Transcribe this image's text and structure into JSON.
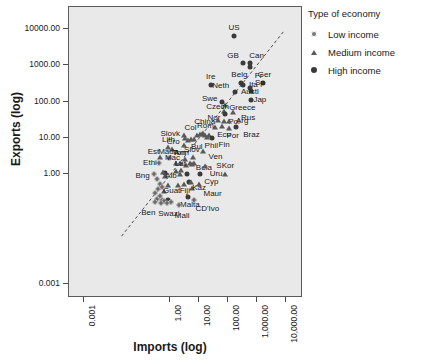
{
  "chart_data": {
    "type": "scatter",
    "title": "",
    "xlabel": "Imports (log)",
    "ylabel": "Exports (log)",
    "xscale": "log",
    "yscale": "log",
    "grid": false,
    "xticks": [
      "0.001",
      "1.00",
      "10.00",
      "100.00",
      "1,000.00",
      "10,000.00"
    ],
    "xtick_values": [
      0.001,
      1.0,
      10.0,
      100.0,
      1000.0,
      10000.0
    ],
    "yticks": [
      "10000.00",
      "1000.00",
      "100.00",
      "10.00",
      "1.00",
      "0.001"
    ],
    "ytick_values": [
      10000.0,
      1000.0,
      100.0,
      10.0,
      1.0,
      0.001
    ],
    "xlim": [
      0.0003,
      40000.0
    ],
    "ylim": [
      0.0004,
      40000.0
    ],
    "reference_line": {
      "style": "dashed",
      "description": "diagonal y = x trend line"
    },
    "legend": {
      "title": "Type of economy",
      "position": "right",
      "entries": [
        {
          "label": "Low income",
          "marker": "small-dot"
        },
        {
          "label": "Medium income",
          "marker": "triangle"
        },
        {
          "label": "High income",
          "marker": "filled-circle"
        }
      ]
    },
    "points": [
      {
        "name": "US",
        "x": 160,
        "y": 6500,
        "group": "High income",
        "lx": 0,
        "ly": -9
      },
      {
        "name": "GB",
        "x": 330,
        "y": 1180,
        "group": "High income",
        "lx": -10,
        "ly": -8
      },
      {
        "name": "Can",
        "x": 560,
        "y": 1160,
        "group": "High income",
        "lx": 7,
        "ly": -8
      },
      {
        "name": "Fr",
        "x": 560,
        "y": 880,
        "group": "High income",
        "lx": 9,
        "ly": 8
      },
      {
        "name": "Ger",
        "x": 1700,
        "y": 330,
        "group": "High income",
        "lx": 1,
        "ly": -9
      },
      {
        "name": "Belg",
        "x": 290,
        "y": 320,
        "group": "High income",
        "lx": -2,
        "ly": -9
      },
      {
        "name": "Ita",
        "x": 340,
        "y": 290,
        "group": "High income",
        "lx": 10,
        "ly": -1
      },
      {
        "name": "Sp",
        "x": 570,
        "y": 240,
        "group": "High income",
        "lx": 10,
        "ly": -6
      },
      {
        "name": "Jap",
        "x": 620,
        "y": 195,
        "group": "High income",
        "lx": 9,
        "ly": 8
      },
      {
        "name": "Ire",
        "x": 25,
        "y": 295,
        "group": "High income",
        "lx": 0,
        "ly": -9
      },
      {
        "name": "Neth",
        "x": 170,
        "y": 190,
        "group": "High income",
        "lx": -14,
        "ly": -7
      },
      {
        "name": "Austl",
        "x": 620,
        "y": 112,
        "group": "High income",
        "lx": -1,
        "ly": -9
      },
      {
        "name": "Swe",
        "x": 60,
        "y": 96,
        "group": "High income",
        "lx": -12,
        "ly": -4
      },
      {
        "name": "Greece",
        "x": 80,
        "y": 82,
        "group": "Medium income",
        "lx": 17,
        "ly": 2
      },
      {
        "name": "Czech",
        "x": 70,
        "y": 55,
        "group": "Medium income",
        "lx": -6,
        "ly": -5
      },
      {
        "name": "Nor",
        "x": 78,
        "y": 46,
        "group": "High income",
        "lx": -11,
        "ly": 3
      },
      {
        "name": "Rus",
        "x": 150,
        "y": 52,
        "group": "Medium income",
        "lx": 15,
        "ly": 5
      },
      {
        "name": "China",
        "x": 44,
        "y": 31,
        "group": "Medium income",
        "lx": -13,
        "ly": 1
      },
      {
        "name": "Pol",
        "x": 72,
        "y": 30,
        "group": "Medium income",
        "lx": 10,
        "ly": 0
      },
      {
        "name": "Arg",
        "x": 110,
        "y": 29,
        "group": "Medium income",
        "lx": 13,
        "ly": -1
      },
      {
        "name": "Braz",
        "x": 195,
        "y": 20,
        "group": "High income",
        "lx": 15,
        "ly": 7
      },
      {
        "name": "Por",
        "x": 105,
        "y": 19,
        "group": "Medium income",
        "lx": 4,
        "ly": 7
      },
      {
        "name": "Ecu",
        "x": 62,
        "y": 21,
        "group": "Medium income",
        "lx": 2,
        "ly": 8
      },
      {
        "name": "Rom",
        "x": 14,
        "y": 14,
        "group": "Medium income",
        "lx": 2,
        "ly": -8
      },
      {
        "name": "Col",
        "x": 11,
        "y": 13,
        "group": "Medium income",
        "lx": -10,
        "ly": -7
      },
      {
        "name": "Fin",
        "x": 28,
        "y": 10,
        "group": "High income",
        "lx": 12,
        "ly": 6
      },
      {
        "name": "Phil",
        "x": 19,
        "y": 10.5,
        "group": "Medium income",
        "lx": 4,
        "ly": 8
      },
      {
        "name": "Bul",
        "x": 6.5,
        "y": 9.5,
        "group": "Medium income",
        "lx": 3,
        "ly": 7
      },
      {
        "name": "Slovk",
        "x": 3.0,
        "y": 12,
        "group": "Medium income",
        "lx": -14,
        "ly": -2
      },
      {
        "name": "Cro",
        "x": 3.0,
        "y": 6.5,
        "group": "Medium income",
        "lx": -11,
        "ly": -4
      },
      {
        "name": "Lith",
        "x": 0.85,
        "y": 5.5,
        "group": "Medium income",
        "lx": 0,
        "ly": -8
      },
      {
        "name": "Arm",
        "x": 1.1,
        "y": 4.9,
        "group": "Medium income",
        "lx": 10,
        "ly": 3
      },
      {
        "name": "Ven",
        "x": 14,
        "y": 4.4,
        "group": "Medium income",
        "lx": 12,
        "ly": 5
      },
      {
        "name": "Slov",
        "x": 6.0,
        "y": 3.1,
        "group": "Medium income",
        "lx": -1,
        "ly": -8
      },
      {
        "name": "Ton",
        "x": 3.2,
        "y": 2.7,
        "group": "Medium income",
        "lx": -6,
        "ly": -7
      },
      {
        "name": "Mada",
        "x": 0.9,
        "y": 2.8,
        "group": "Low income",
        "lx": -1,
        "ly": -7
      },
      {
        "name": "Est",
        "x": 0.45,
        "y": 3.0,
        "group": "Medium income",
        "lx": -7,
        "ly": -6
      },
      {
        "name": "Ethi",
        "x": 0.4,
        "y": 2.0,
        "group": "Low income",
        "lx": -9,
        "ly": -1
      },
      {
        "name": "Mac",
        "x": 1.5,
        "y": 2.1,
        "group": "Medium income",
        "lx": -3,
        "ly": -6
      },
      {
        "name": "Bela",
        "x": 6.5,
        "y": 2.0,
        "group": "Medium income",
        "lx": 10,
        "ly": 4
      },
      {
        "name": "Uru",
        "x": 16,
        "y": 1.7,
        "group": "Medium income",
        "lx": 11,
        "ly": 7
      },
      {
        "name": "Lat",
        "x": 2.4,
        "y": 1.3,
        "group": "Medium income",
        "lx": -1,
        "ly": -7
      },
      {
        "name": "SKor",
        "x": 80,
        "y": 1.05,
        "group": "Medium income",
        "lx": 0,
        "ly": -9
      },
      {
        "name": "Bng",
        "x": 0.26,
        "y": 1.0,
        "group": "Low income",
        "lx": -11,
        "ly": 1
      },
      {
        "name": "Alb",
        "x": 0.55,
        "y": 1.15,
        "group": "Medium income",
        "lx": 8,
        "ly": 3
      },
      {
        "name": "Cyp",
        "x": 11,
        "y": 1.0,
        "group": "High income",
        "lx": 11,
        "ly": 7
      },
      {
        "name": "Kaz",
        "x": 5.2,
        "y": 0.62,
        "group": "Medium income",
        "lx": 8,
        "ly": 5
      },
      {
        "name": "Maur",
        "x": 9.5,
        "y": 0.55,
        "group": "Medium income",
        "lx": 14,
        "ly": 9
      },
      {
        "name": "Guat",
        "x": 0.8,
        "y": 0.5,
        "group": "Medium income",
        "lx": 4,
        "ly": 5
      },
      {
        "name": "Fiji",
        "x": 1.8,
        "y": 0.5,
        "group": "Medium income",
        "lx": 7,
        "ly": 5
      },
      {
        "name": "Malta",
        "x": 4.0,
        "y": 0.24,
        "group": "High income",
        "lx": 2,
        "ly": 7
      },
      {
        "name": "CD'Ivo",
        "x": 6.8,
        "y": 0.2,
        "group": "Low income",
        "lx": 13,
        "ly": 8
      },
      {
        "name": "Mali",
        "x": 2.0,
        "y": 0.14,
        "group": "Low income",
        "lx": 3,
        "ly": 10
      },
      {
        "name": "Swazi",
        "x": 0.75,
        "y": 0.16,
        "group": "Low income",
        "lx": 2,
        "ly": 10
      },
      {
        "name": "Ben",
        "x": 0.3,
        "y": 0.17,
        "group": "Low income",
        "lx": -7,
        "ly": 10
      }
    ],
    "extra_markers": [
      {
        "x": 0.33,
        "y": 0.75,
        "group": "Low income"
      },
      {
        "x": 0.42,
        "y": 0.55,
        "group": "Low income"
      },
      {
        "x": 0.5,
        "y": 0.45,
        "group": "Low income"
      },
      {
        "x": 0.36,
        "y": 0.4,
        "group": "Low income"
      },
      {
        "x": 0.6,
        "y": 0.35,
        "group": "Medium income"
      },
      {
        "x": 0.3,
        "y": 0.3,
        "group": "Low income"
      },
      {
        "x": 0.42,
        "y": 0.25,
        "group": "Low income"
      },
      {
        "x": 0.34,
        "y": 0.21,
        "group": "Low income"
      },
      {
        "x": 0.52,
        "y": 0.2,
        "group": "Low income"
      },
      {
        "x": 0.62,
        "y": 0.19,
        "group": "Low income"
      },
      {
        "x": 0.46,
        "y": 0.165,
        "group": "Low income"
      },
      {
        "x": 0.8,
        "y": 0.2,
        "group": "High income"
      },
      {
        "x": 1.05,
        "y": 0.17,
        "group": "Low income"
      },
      {
        "x": 0.66,
        "y": 0.92,
        "group": "Medium income"
      },
      {
        "x": 2.9,
        "y": 0.55,
        "group": "Medium income"
      },
      {
        "x": 4.3,
        "y": 0.6,
        "group": "High income"
      },
      {
        "x": 3.9,
        "y": 1.05,
        "group": "High income"
      },
      {
        "x": 5.4,
        "y": 0.42,
        "group": "Medium income"
      },
      {
        "x": 2.1,
        "y": 1.0,
        "group": "Medium income"
      },
      {
        "x": 4.6,
        "y": 2.0,
        "group": "Medium income"
      },
      {
        "x": 5.6,
        "y": 1.95,
        "group": "Medium income"
      },
      {
        "x": 3.6,
        "y": 1.85,
        "group": "Medium income"
      },
      {
        "x": 2.2,
        "y": 2.0,
        "group": "Medium income"
      },
      {
        "x": 4.0,
        "y": 8.6,
        "group": "Medium income"
      },
      {
        "x": 5.0,
        "y": 9.2,
        "group": "Medium income"
      },
      {
        "x": 3.2,
        "y": 9.8,
        "group": "Medium income"
      },
      {
        "x": 8.5,
        "y": 12,
        "group": "Medium income"
      },
      {
        "x": 12,
        "y": 13,
        "group": "Medium income"
      },
      {
        "x": 16,
        "y": 12,
        "group": "Medium income"
      },
      {
        "x": 21,
        "y": 12,
        "group": "Medium income"
      },
      {
        "x": 34,
        "y": 20,
        "group": "Medium income"
      },
      {
        "x": 0.65,
        "y": 1.1,
        "group": "High income"
      },
      {
        "x": 1.6,
        "y": 1.25,
        "group": "Medium income"
      }
    ]
  }
}
